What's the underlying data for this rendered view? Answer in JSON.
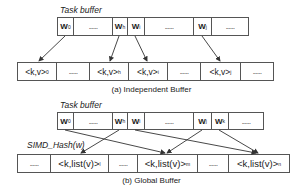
{
  "independent": {
    "task_label": "Task buffer",
    "task_cells": [
      {
        "text": "W",
        "sub": "0",
        "kind": "w",
        "width": 16
      },
      {
        "text": "......",
        "sub": "",
        "kind": "dots",
        "width": 39
      },
      {
        "text": "W",
        "sub": "h",
        "kind": "w",
        "width": 15
      },
      {
        "text": "W",
        "sub": "i",
        "kind": "w",
        "width": 17
      },
      {
        "text": "......",
        "sub": "",
        "kind": "dots",
        "width": 49
      },
      {
        "text": "W",
        "sub": "j",
        "kind": "w",
        "width": 18
      },
      {
        "text": "......",
        "sub": "",
        "kind": "dots",
        "width": 36
      }
    ],
    "kv_cells": [
      {
        "text": "<k,v>",
        "sub": "0",
        "kind": "kv",
        "width": 39
      },
      {
        "text": "......",
        "sub": "",
        "kind": "dots",
        "width": 33
      },
      {
        "text": "<k,v>",
        "sub": "h",
        "kind": "kv",
        "width": 39
      },
      {
        "text": "<k,v>",
        "sub": "i",
        "kind": "kv",
        "width": 39
      },
      {
        "text": "......",
        "sub": "",
        "kind": "dots",
        "width": 33
      },
      {
        "text": "<k,v>",
        "sub": "j",
        "kind": "kv",
        "width": 40
      },
      {
        "text": "......",
        "sub": "",
        "kind": "dots",
        "width": 32
      }
    ],
    "caption": "(a) Independent Buffer"
  },
  "global": {
    "task_label": "Task buffer",
    "hash_label": "SIMD_Hash(w)",
    "task_cells": [
      {
        "text": "W",
        "sub": "0",
        "kind": "w",
        "width": 16
      },
      {
        "text": "......",
        "sub": "",
        "kind": "dots",
        "width": 39
      },
      {
        "text": "W",
        "sub": "h",
        "kind": "w",
        "width": 15
      },
      {
        "text": "W",
        "sub": "i",
        "kind": "w",
        "width": 17
      },
      {
        "text": "......",
        "sub": "",
        "kind": "dots",
        "width": 49
      },
      {
        "text": "W",
        "sub": "j",
        "kind": "w",
        "width": 18
      },
      {
        "text": "W",
        "sub": "k",
        "kind": "w",
        "width": 17
      },
      {
        "text": "......",
        "sub": "",
        "kind": "dots",
        "width": 34
      }
    ],
    "list_cells": [
      {
        "text": "......",
        "sub": "",
        "kind": "dots",
        "width": 33
      },
      {
        "text": "<k,list(v)>",
        "sub": "l",
        "kind": "kl",
        "width": 58
      },
      {
        "text": "......",
        "sub": "",
        "kind": "dots",
        "width": 29
      },
      {
        "text": "<k,list(v)>",
        "sub": "m",
        "kind": "kl",
        "width": 60
      },
      {
        "text": "......",
        "sub": "",
        "kind": "dots",
        "width": 31
      },
      {
        "text": "<k,list(v)>",
        "sub": "n",
        "kind": "kl",
        "width": 60
      }
    ],
    "caption": "(b) Global Buffer"
  },
  "colors": {
    "line": "#555555",
    "arrow": "#333333",
    "text": "#1a1a1a"
  }
}
